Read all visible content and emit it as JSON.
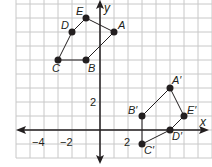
{
  "graph": {
    "x_axis_label": "x",
    "y_axis_label": "y",
    "tick_labels": {
      "x": [
        "−4",
        "−2",
        "2"
      ],
      "y": [
        "2"
      ]
    },
    "grid_spacing": 1,
    "axis_color": "#231f20",
    "grid_color": "#c8c8c8",
    "point_color": "#231f20",
    "pre_image": {
      "points": [
        {
          "label": "A",
          "x": 1,
          "y": 7
        },
        {
          "label": "B",
          "x": -1,
          "y": 5
        },
        {
          "label": "C",
          "x": -3,
          "y": 5
        },
        {
          "label": "D",
          "x": -2,
          "y": 7
        },
        {
          "label": "E",
          "x": -1,
          "y": 8
        }
      ]
    },
    "image": {
      "points": [
        {
          "label": "A′",
          "x": 5,
          "y": 3
        },
        {
          "label": "B′",
          "x": 3,
          "y": 1
        },
        {
          "label": "C′",
          "x": 3,
          "y": -1
        },
        {
          "label": "D′",
          "x": 5,
          "y": 0
        },
        {
          "label": "E′",
          "x": 6,
          "y": 1
        }
      ]
    }
  }
}
